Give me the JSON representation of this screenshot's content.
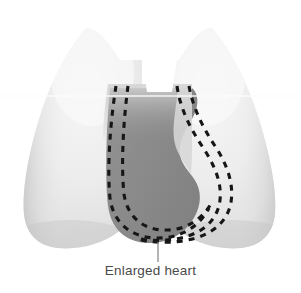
{
  "figure": {
    "kind": "medical-illustration",
    "background_color": "#ffffff"
  },
  "callout": {
    "label": "Enlarged heart",
    "text_color": "#4a4a4a",
    "leader_line_color": "#8c8c8c"
  },
  "anatomy": {
    "left_lung": {
      "name": "left-lung",
      "fill_light": "#f2f2f2",
      "fill_mid": "#e4e4e4",
      "fill_edge": "#c9c9c9"
    },
    "right_lung": {
      "name": "right-lung",
      "fill_light": "#f2f2f2",
      "fill_mid": "#e4e4e4",
      "fill_edge": "#c9c9c9"
    },
    "heart": {
      "name": "enlarged-heart-silhouette",
      "fill": "#8d8d8d",
      "fill_light": "#9a9a9a",
      "fill_dark": "#7f7f7f"
    },
    "mediastinal_notch": {
      "name": "tracheal-notch",
      "fill": "#ffffff"
    },
    "scan_line": {
      "name": "horizontal-scan-line",
      "color": "#fdfdfd",
      "y": 96
    },
    "dashed_borders": {
      "name": "enlarged-cardiac-border-dashed-outline",
      "color": "#161616",
      "stroke_width": 3.1,
      "dash_pattern": "6 6"
    }
  }
}
